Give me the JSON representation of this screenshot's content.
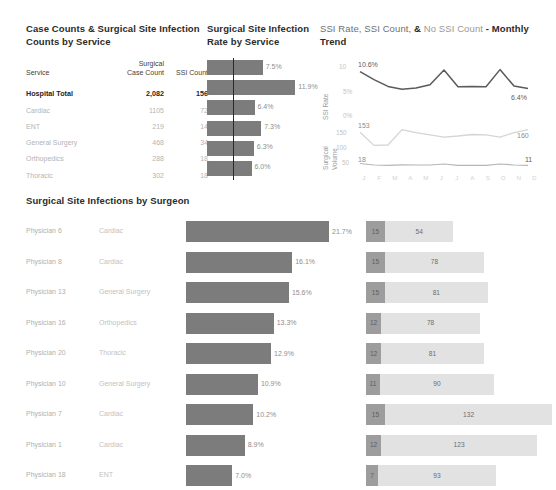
{
  "service_table": {
    "title": "Case Counts & Surgical Site Infection Counts by Service",
    "headers": [
      "Service",
      "Surgical Case Count",
      "SSI Count"
    ],
    "header_service": "Service",
    "header_case_count_l1": "Surgical",
    "header_case_count_l2": "Case Count",
    "header_ssi_count": "SSI Count",
    "rows": [
      {
        "service": "Hospital Total",
        "case_count": "2,082",
        "ssi_count": "156",
        "total": true
      },
      {
        "service": "Cardiac",
        "case_count": "1105",
        "ssi_count": "72",
        "total": false
      },
      {
        "service": "ENT",
        "case_count": "219",
        "ssi_count": "14",
        "total": false
      },
      {
        "service": "General Surgery",
        "case_count": "468",
        "ssi_count": "34",
        "total": false
      },
      {
        "service": "Orthopedics",
        "case_count": "288",
        "ssi_count": "18",
        "total": false
      },
      {
        "service": "Thoracic",
        "case_count": "302",
        "ssi_count": "18",
        "total": false
      }
    ]
  },
  "rate_chart": {
    "title": "Surgical Site Infection Rate by Service",
    "benchmark_label": "7.5%",
    "bars": [
      {
        "service": "Hospital Total",
        "label": "7.5%",
        "value": 7.5
      },
      {
        "service": "Cardiac",
        "label": "11.9%",
        "value": 11.9
      },
      {
        "service": "ENT",
        "label": "6.4%",
        "value": 6.4
      },
      {
        "service": "General Surgery",
        "label": "7.3%",
        "value": 7.3
      },
      {
        "service": "Orthopedics",
        "label": "6.3%",
        "value": 6.3
      },
      {
        "service": "Thoracic",
        "label": "6.0%",
        "value": 6.0
      }
    ]
  },
  "trend_chart": {
    "title_part1": "SSI Rate, SSI Count,",
    "title_amp": "&",
    "title_part2": "No SSI Count",
    "title_part3": "- Monthly",
    "title_part4": "Trend",
    "axis_rate_label": "SSI Rate",
    "axis_volume_label_l1": "Surgical",
    "axis_volume_label_l2": "Volume",
    "rate_ticks": [
      "10%",
      "5%",
      "0%"
    ],
    "volume_ticks": [
      "150",
      "100",
      "50"
    ],
    "months": [
      "J",
      "F",
      "M",
      "A",
      "M",
      "J",
      "J",
      "A",
      "S",
      "O",
      "N",
      "D"
    ],
    "rate_first_label": "10.6%",
    "rate_last_label": "6.4%",
    "volume_first_label": "153",
    "volume_last_label": "160",
    "ssi_first_label": "18",
    "ssi_last_label": "11"
  },
  "chart_data": [
    {
      "type": "bar",
      "title": "Surgical Site Infection Rate by Service",
      "orientation": "horizontal",
      "categories": [
        "Hospital Total",
        "Cardiac",
        "ENT",
        "General Surgery",
        "Orthopedics",
        "Thoracic"
      ],
      "values": [
        7.5,
        11.9,
        6.4,
        7.3,
        6.3,
        6.0
      ],
      "value_labels": [
        "7.5%",
        "11.9%",
        "6.4%",
        "7.3%",
        "6.3%",
        "6.0%"
      ],
      "reference_line": 7.5,
      "xlabel": "SSI Rate",
      "ylabel": "",
      "xlim": [
        0,
        13
      ],
      "grid": false,
      "legend": "none"
    },
    {
      "type": "table",
      "title": "Case Counts & Surgical Site Infection Counts by Service",
      "columns": [
        "Service",
        "Surgical Case Count",
        "SSI Count"
      ],
      "rows": [
        [
          "Hospital Total",
          2082,
          156
        ],
        [
          "Cardiac",
          1105,
          72
        ],
        [
          "ENT",
          219,
          14
        ],
        [
          "General Surgery",
          468,
          34
        ],
        [
          "Orthopedics",
          288,
          18
        ],
        [
          "Thoracic",
          302,
          18
        ]
      ]
    },
    {
      "type": "line",
      "title": "SSI Rate, SSI Count, & No SSI Count - Monthly Trend",
      "x": [
        "J",
        "F",
        "M",
        "A",
        "M",
        "J",
        "J",
        "A",
        "S",
        "O",
        "N",
        "D"
      ],
      "series": [
        {
          "name": "SSI Rate",
          "unit": "%",
          "ylim": [
            0,
            12
          ],
          "yticks": [
            0,
            5,
            10
          ],
          "values": [
            10.6,
            8.6,
            6.9,
            6.2,
            6.5,
            7.3,
            11.0,
            6.8,
            6.9,
            6.8,
            11.1,
            7.0,
            6.4
          ],
          "first_label": "10.6%",
          "last_label": "6.4%"
        },
        {
          "name": "Surgical Volume",
          "unit": "cases",
          "ylim": [
            50,
            175
          ],
          "yticks": [
            50,
            100,
            150
          ],
          "values": [
            153,
            118,
            119,
            160,
            152,
            146,
            140,
            143,
            147,
            146,
            140,
            152,
            160
          ],
          "first_label": "153",
          "last_label": "160"
        },
        {
          "name": "SSI Count",
          "unit": "cases",
          "ylim": [
            0,
            30
          ],
          "values": [
            18,
            12,
            11,
            13,
            12,
            12,
            16,
            11,
            11,
            11,
            16,
            12,
            11
          ],
          "first_label": "18",
          "last_label": "11"
        }
      ],
      "xlabel": "Month",
      "grid": false,
      "legend": "top"
    },
    {
      "type": "bar",
      "title": "Surgical Site Infections by Surgeon",
      "orientation": "horizontal",
      "categories": [
        "Physician 6",
        "Physician 8",
        "Physician 13",
        "Physician 16",
        "Physician 20",
        "Physician 10",
        "Physician 7",
        "Physician 1",
        "Physician 18"
      ],
      "category_services": [
        "Cardiac",
        "Cardiac",
        "General Surgery",
        "Orthopedics",
        "Thoracic",
        "General Surgery",
        "Cardiac",
        "Cardiac",
        "ENT"
      ],
      "values": [
        21.7,
        16.1,
        15.6,
        13.3,
        12.9,
        10.9,
        10.2,
        8.9,
        7.0
      ],
      "value_labels": [
        "21.7%",
        "16.1%",
        "15.6%",
        "13.3%",
        "12.9%",
        "10.9%",
        "10.2%",
        "8.9%",
        "7.0%"
      ],
      "xlabel": "SSI Rate",
      "xlim": [
        0,
        23
      ],
      "grid": false,
      "legend": "none"
    },
    {
      "type": "bar",
      "title": "SSI Count and No SSI Count by Surgeon",
      "orientation": "horizontal",
      "stacked": true,
      "categories": [
        "Physician 6",
        "Physician 8",
        "Physician 13",
        "Physician 16",
        "Physician 20",
        "Physician 10",
        "Physician 7",
        "Physician 1",
        "Physician 18"
      ],
      "series": [
        {
          "name": "SSI Count",
          "values": [
            15,
            15,
            15,
            12,
            12,
            11,
            15,
            12,
            7
          ],
          "color": "#9d9d9d"
        },
        {
          "name": "No SSI Count",
          "values": [
            54,
            78,
            81,
            78,
            81,
            90,
            132,
            123,
            93
          ],
          "color": "#e2e2e2"
        }
      ],
      "grid": false,
      "legend": "none"
    }
  ],
  "surgeon_chart": {
    "title": "Surgical Site Infections by Surgeon",
    "rows": [
      {
        "name": "Physician 6",
        "service": "Cardiac",
        "pct_label": "21.7%",
        "pct": 21.7,
        "ssi": "15",
        "ssi_val": 15,
        "nossi": "54",
        "nossi_val": 54
      },
      {
        "name": "Physician 8",
        "service": "Cardiac",
        "pct_label": "16.1%",
        "pct": 16.1,
        "ssi": "15",
        "ssi_val": 15,
        "nossi": "78",
        "nossi_val": 78
      },
      {
        "name": "Physician 13",
        "service": "General Surgery",
        "pct_label": "15.6%",
        "pct": 15.6,
        "ssi": "15",
        "ssi_val": 15,
        "nossi": "81",
        "nossi_val": 81
      },
      {
        "name": "Physician 16",
        "service": "Orthopedics",
        "pct_label": "13.3%",
        "pct": 13.3,
        "ssi": "12",
        "ssi_val": 12,
        "nossi": "78",
        "nossi_val": 78
      },
      {
        "name": "Physician 20",
        "service": "Thoracic",
        "pct_label": "12.9%",
        "pct": 12.9,
        "ssi": "12",
        "ssi_val": 12,
        "nossi": "81",
        "nossi_val": 81
      },
      {
        "name": "Physician 10",
        "service": "General Surgery",
        "pct_label": "10.9%",
        "pct": 10.9,
        "ssi": "11",
        "ssi_val": 11,
        "nossi": "90",
        "nossi_val": 90
      },
      {
        "name": "Physician 7",
        "service": "Cardiac",
        "pct_label": "10.2%",
        "pct": 10.2,
        "ssi": "15",
        "ssi_val": 15,
        "nossi": "132",
        "nossi_val": 132
      },
      {
        "name": "Physician 1",
        "service": "Cardiac",
        "pct_label": "8.9%",
        "pct": 8.9,
        "ssi": "12",
        "ssi_val": 12,
        "nossi": "123",
        "nossi_val": 123
      },
      {
        "name": "Physician 18",
        "service": "ENT",
        "pct_label": "7.0%",
        "pct": 7.0,
        "ssi": "7",
        "ssi_val": 7,
        "nossi": "93",
        "nossi_val": 93
      }
    ]
  },
  "colors": {
    "bar_gray": "#7c7c7c",
    "stack_ssi": "#9d9d9d",
    "stack_nossi": "#e2e2e2",
    "reference_line": "#2a2a2a",
    "text_dark": "#2b2b2b",
    "text_muted": "#b4b4b4"
  }
}
